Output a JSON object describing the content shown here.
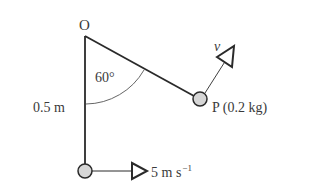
{
  "diagram": {
    "pivot_label": "O",
    "angle_label": "60°",
    "length_label": "0.5 m",
    "particle_label": "P (0.2 kg)",
    "velocity_label": "v",
    "bottom_speed": {
      "value": "5 m s",
      "exponent": "−1"
    },
    "colors": {
      "line": "#2a2a2a",
      "ball_fill": "#d6d6d6",
      "text": "#3a3a3a"
    }
  }
}
